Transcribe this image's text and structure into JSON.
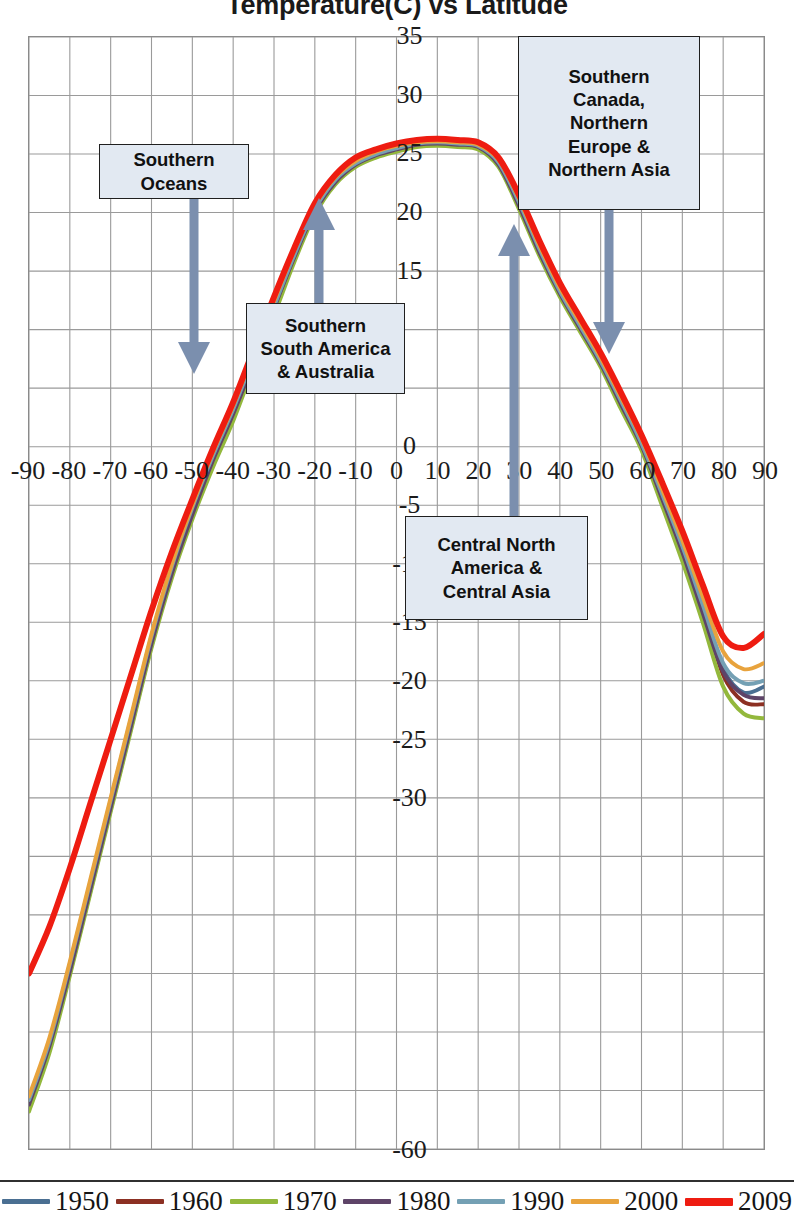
{
  "chart_data": {
    "type": "line",
    "title": "Temperature(C) vs Latitude",
    "xlabel": "",
    "ylabel": "",
    "xlim": [
      -90,
      90
    ],
    "ylim": [
      -60,
      35
    ],
    "grid": true,
    "legend_position": "bottom",
    "xticks": [
      "-90",
      "-80",
      "-70",
      "-60",
      "-50",
      "-40",
      "-30",
      "-20",
      "-10",
      "0",
      "10",
      "20",
      "30",
      "40",
      "50",
      "60",
      "70",
      "80",
      "90"
    ],
    "yticks": [
      "35",
      "30",
      "25",
      "20",
      "15",
      "10",
      "5",
      "0",
      "-5",
      "-10",
      "-15",
      "-20",
      "-25",
      "-30",
      "-35",
      "-40",
      "-45",
      "-50",
      "-55",
      "-60"
    ],
    "yticks_hidden": [
      "10",
      "5",
      "-35",
      "-40",
      "-45",
      "-50",
      "-55"
    ],
    "x": [
      -90,
      -85,
      -80,
      -75,
      -70,
      -65,
      -60,
      -55,
      -50,
      -45,
      -40,
      -35,
      -30,
      -25,
      -20,
      -15,
      -10,
      -5,
      0,
      5,
      10,
      15,
      20,
      25,
      30,
      35,
      40,
      45,
      50,
      55,
      60,
      65,
      70,
      75,
      80,
      85,
      90
    ],
    "series": [
      {
        "name": "1950",
        "color": "#4a6f92",
        "width": 4,
        "values": [
          -56.5,
          -51.5,
          -45.0,
          -38.0,
          -31.0,
          -24.0,
          -17.0,
          -11.0,
          -6.0,
          -1.5,
          2.5,
          7.0,
          11.5,
          16.0,
          20.0,
          22.5,
          24.0,
          24.8,
          25.3,
          25.7,
          25.8,
          25.7,
          25.5,
          24.0,
          20.5,
          16.5,
          13.0,
          10.0,
          7.0,
          3.5,
          0.0,
          -4.5,
          -9.0,
          -14.0,
          -19.0,
          -21.0,
          -20.5
        ]
      },
      {
        "name": "1960",
        "color": "#8c3023",
        "width": 4,
        "values": [
          -56.0,
          -51.0,
          -44.5,
          -37.5,
          -30.5,
          -23.5,
          -16.5,
          -10.5,
          -5.5,
          -1.0,
          3.0,
          7.5,
          12.0,
          16.5,
          20.2,
          22.8,
          24.2,
          24.9,
          25.4,
          25.8,
          25.9,
          25.8,
          25.6,
          24.2,
          20.8,
          16.8,
          13.2,
          10.2,
          7.2,
          3.8,
          0.2,
          -4.2,
          -8.8,
          -13.8,
          -19.5,
          -21.8,
          -22.0
        ]
      },
      {
        "name": "1970",
        "color": "#93b83c",
        "width": 4,
        "values": [
          -56.8,
          -51.8,
          -45.2,
          -38.2,
          -31.2,
          -24.2,
          -17.2,
          -11.2,
          -6.2,
          -1.8,
          2.2,
          6.8,
          11.2,
          15.8,
          19.8,
          22.4,
          23.9,
          24.7,
          25.2,
          25.6,
          25.7,
          25.6,
          25.4,
          23.9,
          20.3,
          16.3,
          12.8,
          9.8,
          6.8,
          3.2,
          -0.3,
          -5.0,
          -9.8,
          -15.0,
          -20.5,
          -22.8,
          -23.2
        ]
      },
      {
        "name": "1980",
        "color": "#5e4468",
        "width": 4,
        "values": [
          -56.2,
          -51.2,
          -44.8,
          -37.8,
          -30.8,
          -23.8,
          -16.8,
          -10.8,
          -5.8,
          -1.2,
          2.8,
          7.2,
          11.8,
          16.2,
          20.1,
          22.6,
          24.1,
          24.9,
          25.4,
          25.8,
          25.9,
          25.8,
          25.6,
          24.1,
          20.6,
          16.6,
          13.1,
          10.1,
          7.1,
          3.6,
          0.1,
          -4.4,
          -9.0,
          -14.2,
          -19.2,
          -21.2,
          -21.5
        ]
      },
      {
        "name": "1990",
        "color": "#74a0b4",
        "width": 4,
        "values": [
          -55.8,
          -50.8,
          -44.2,
          -37.2,
          -30.2,
          -23.2,
          -16.2,
          -10.2,
          -5.2,
          -0.8,
          3.2,
          7.6,
          12.0,
          16.4,
          20.3,
          22.8,
          24.2,
          25.0,
          25.5,
          25.9,
          26.0,
          25.9,
          25.7,
          24.3,
          20.9,
          16.9,
          13.3,
          10.3,
          7.3,
          3.9,
          0.3,
          -4.0,
          -8.5,
          -13.5,
          -18.5,
          -20.2,
          -20.0
        ]
      },
      {
        "name": "2000",
        "color": "#e8a33d",
        "width": 4,
        "values": [
          -55.5,
          -50.5,
          -44.0,
          -37.0,
          -30.0,
          -23.0,
          -16.0,
          -10.0,
          -5.0,
          -0.5,
          3.5,
          8.0,
          12.4,
          16.8,
          20.6,
          23.0,
          24.4,
          25.2,
          25.7,
          26.0,
          26.1,
          26.0,
          25.8,
          24.5,
          21.2,
          17.2,
          13.6,
          10.6,
          7.6,
          4.2,
          0.7,
          -3.6,
          -8.0,
          -12.8,
          -17.5,
          -19.0,
          -18.5
        ]
      },
      {
        "name": "2009",
        "color": "#ee1c11",
        "width": 6,
        "values": [
          -45.0,
          -41.0,
          -36.0,
          -30.5,
          -25.0,
          -19.5,
          -14.0,
          -9.0,
          -4.5,
          -0.2,
          3.8,
          8.3,
          12.8,
          17.0,
          20.8,
          23.2,
          24.7,
          25.4,
          25.9,
          26.2,
          26.3,
          26.2,
          26.0,
          24.7,
          21.5,
          17.6,
          14.0,
          11.0,
          8.0,
          4.6,
          1.0,
          -3.0,
          -7.2,
          -11.8,
          -16.2,
          -17.2,
          -16.0
        ]
      }
    ],
    "annotations": [
      {
        "id": "southern-oceans",
        "text_lines": [
          "Southern",
          "Oceans"
        ],
        "arrow": "down"
      },
      {
        "id": "southern-south-america-australia",
        "text_lines": [
          "Southern",
          "South America",
          "& Australia"
        ],
        "arrow": "up"
      },
      {
        "id": "southern-canada-northern-europe-asia",
        "text_lines": [
          "Southern",
          "Canada,",
          "Northern",
          "Europe &",
          "Northern Asia"
        ],
        "arrow": "down"
      },
      {
        "id": "central-north-america-central-asia",
        "text_lines": [
          "Central North",
          "America &",
          "Central Asia"
        ],
        "arrow": "up"
      }
    ]
  },
  "colors": {
    "grid": "#9a9a9a",
    "frame": "#8a8a8a",
    "callout_fill": "#e2e9f2",
    "callout_border": "#1f1f1f",
    "arrow": "#7b8fae",
    "text": "#111111"
  },
  "legend": {
    "items": [
      {
        "label": "1950",
        "color": "#4a6f92"
      },
      {
        "label": "1960",
        "color": "#8c3023"
      },
      {
        "label": "1970",
        "color": "#93b83c"
      },
      {
        "label": "1980",
        "color": "#5e4468"
      },
      {
        "label": "1990",
        "color": "#74a0b4"
      },
      {
        "label": "2000",
        "color": "#e8a33d"
      },
      {
        "label": "2009",
        "color": "#ee1c11"
      }
    ]
  }
}
